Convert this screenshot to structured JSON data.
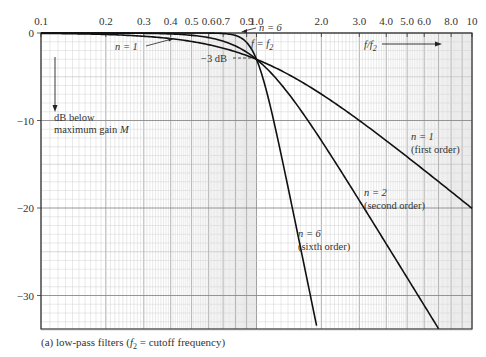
{
  "chart_data": {
    "type": "line",
    "title": "",
    "xlabel": "f/f2",
    "ylabel": "dB below maximum gain M",
    "xscale": "log",
    "xlim": [
      0.1,
      10
    ],
    "ylim": [
      -34,
      0
    ],
    "grid": true,
    "x_tick_labels": [
      "0.1",
      "0.2",
      "0.3",
      "0.4",
      "0.5",
      "0.6",
      "0.7",
      "0.9",
      "1.0",
      "2.0",
      "3.0",
      "4.0",
      "5.0",
      "6.0",
      "8.0",
      "10"
    ],
    "x_tick_values": [
      0.1,
      0.2,
      0.3,
      0.4,
      0.5,
      0.6,
      0.7,
      0.9,
      1.0,
      2.0,
      3.0,
      4.0,
      5.0,
      6.0,
      8.0,
      10
    ],
    "y_tick_labels": [
      "0",
      "-10",
      "-20",
      "-30"
    ],
    "y_tick_values": [
      0,
      -10,
      -20,
      -30
    ],
    "series": [
      {
        "name": "n = 1 (first order)",
        "order": 1,
        "x": [
          0.1,
          0.2,
          0.3,
          0.5,
          0.7,
          1.0,
          2.0,
          3.0,
          5.0,
          10
        ],
        "y": [
          -0.04,
          -0.17,
          -0.37,
          -0.97,
          -1.74,
          -3.0,
          -7.0,
          -10.0,
          -14.2,
          -20.0
        ]
      },
      {
        "name": "n = 2 (second order)",
        "order": 2,
        "x": [
          0.1,
          0.3,
          0.5,
          0.7,
          1.0,
          2.0,
          3.0,
          5.0,
          7.0
        ],
        "y": [
          0.0,
          -0.04,
          -0.26,
          -0.87,
          -3.0,
          -12.3,
          -19.1,
          -28.0,
          -33.8
        ]
      },
      {
        "name": "n = 6 (sixth order)",
        "order": 6,
        "x": [
          0.1,
          0.5,
          0.7,
          0.9,
          1.0,
          1.2,
          1.5,
          1.9
        ],
        "y": [
          0.0,
          0.0,
          -0.06,
          -0.95,
          -3.0,
          -9.7,
          -21.1,
          -33.4
        ]
      }
    ],
    "annotations": [
      {
        "text": "n = 1",
        "target": "n=1 curve near f=0.45"
      },
      {
        "text": "n = 6",
        "target": "n=6 curve near f=0.95"
      },
      {
        "text": "f = f2",
        "target": "cutoff point f/f2 = 1"
      },
      {
        "text": "-3 dB",
        "target": "cutoff point -3 dB"
      },
      {
        "text": "f/f2 →",
        "target": "x-axis direction"
      },
      {
        "text": "dB below maximum gain M",
        "target": "y-axis direction (down)"
      }
    ]
  },
  "axis": {
    "x_ticks": [
      {
        "label": "0.1",
        "v": 0.1
      },
      {
        "label": "0.2",
        "v": 0.2
      },
      {
        "label": "0.3",
        "v": 0.3
      },
      {
        "label": "0.4",
        "v": 0.4
      },
      {
        "label": "0.5",
        "v": 0.5
      },
      {
        "label": "0.6",
        "v": 0.6
      },
      {
        "label": "0.7",
        "v": 0.7
      },
      {
        "label": "0.9",
        "v": 0.9
      },
      {
        "label": "1.0",
        "v": 1.0
      },
      {
        "label": "2.0",
        "v": 2.0
      },
      {
        "label": "3.0",
        "v": 3.0
      },
      {
        "label": "4.0",
        "v": 4.0
      },
      {
        "label": "5.0",
        "v": 5.0
      },
      {
        "label": "6.0",
        "v": 6.0
      },
      {
        "label": "8.0",
        "v": 8.0
      },
      {
        "label": "10",
        "v": 10
      }
    ],
    "y_ticks": [
      {
        "label": "0",
        "v": 0
      },
      {
        "label": "−10",
        "v": -10
      },
      {
        "label": "−20",
        "v": -20
      },
      {
        "label": "−30",
        "v": -30
      }
    ]
  },
  "labels": {
    "n1_short": "n = 1",
    "n6_short": "n = 6",
    "f_eq_f2": "f = f",
    "f_eq_f2_sub": "2",
    "minus3db": "−3 dB",
    "ff2": "f/f",
    "ff2_sub": "2",
    "dB_below_1": "dB below",
    "dB_below_2": "maximum gain ",
    "dB_below_M": "M",
    "n1_long_1": "n = 1",
    "n1_long_2": "(first order)",
    "n2_long_1": "n = 2",
    "n2_long_2": "(second order)",
    "n6_long_1": "n = 6",
    "n6_long_2": "(sixth order)"
  },
  "caption": {
    "prefix": "(a) low-pass filters (",
    "f": "f",
    "sub": "2",
    "suffix": " = cutoff frequency)"
  }
}
